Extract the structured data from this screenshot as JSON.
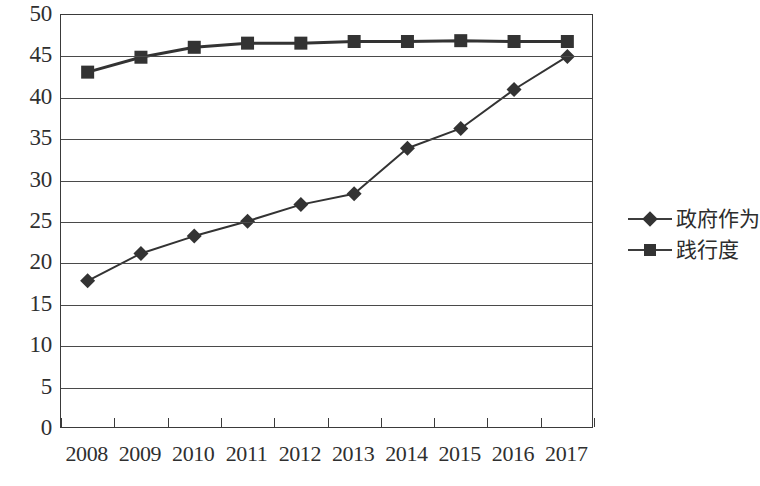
{
  "chart_data": {
    "type": "line",
    "title": "",
    "subtitle": "",
    "xlabel": "",
    "ylabel": "",
    "categories": [
      "2008",
      "2009",
      "2010",
      "2011",
      "2012",
      "2013",
      "2014",
      "2015",
      "2016",
      "2017"
    ],
    "series": [
      {
        "name": "政府作为",
        "marker": "diamond",
        "color": "#333333",
        "values": [
          17.9,
          21.2,
          23.3,
          25.1,
          27.1,
          28.4,
          33.9,
          36.3,
          41.0,
          45.0
        ]
      },
      {
        "name": "践行度",
        "marker": "square",
        "color": "#333333",
        "values": [
          43.1,
          44.9,
          46.1,
          46.6,
          46.6,
          46.8,
          46.8,
          46.9,
          46.8,
          46.8
        ]
      }
    ],
    "ylim": [
      0,
      50
    ],
    "ytick_step": 5,
    "yticks": [
      "50",
      "45",
      "40",
      "35",
      "30",
      "25",
      "20",
      "15",
      "10",
      "5",
      "0"
    ],
    "grid": true,
    "grid_axis": "y",
    "legend_position": "right"
  },
  "legend": {
    "items": [
      {
        "label": "政府作为",
        "marker": "diamond"
      },
      {
        "label": "践行度",
        "marker": "square"
      }
    ]
  },
  "colors": {
    "line": "#3d3d3d",
    "marker": "#333333",
    "grid": "#4a4a4a",
    "frame": "#3a3a3a",
    "text": "#2f2f2f",
    "background": "#ffffff"
  }
}
